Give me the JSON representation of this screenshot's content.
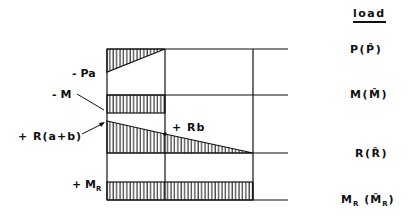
{
  "legend": {
    "header": "load",
    "rows": [
      {
        "id": "P",
        "label": "P(P̂)"
      },
      {
        "id": "M",
        "label": "M(M̂)"
      },
      {
        "id": "R",
        "label": "R(R̂)"
      },
      {
        "id": "MR",
        "label_main": "M",
        "label_sub": "R",
        "label_paren_main": "M̂",
        "label_paren_sub": "R"
      }
    ]
  },
  "annotations": {
    "pa": "- Pa",
    "m": "- M",
    "r_ab": "+ R(a+b)",
    "rb": "+ Rb",
    "mr_main": "+ M",
    "mr_sub": "R"
  },
  "colors": {
    "ink": "#111111",
    "background": "#ffffff"
  }
}
